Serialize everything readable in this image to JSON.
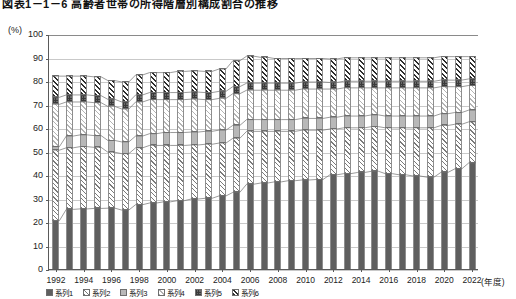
{
  "title": {
    "text": "図表1－1－6 高齢者世帯の所得階層別構成割合の推移",
    "note": "clipped at top edge of screenshot"
  },
  "axes": {
    "y_unit_label": "(%)",
    "y_ticks": [
      0,
      10,
      20,
      30,
      40,
      50,
      60,
      70,
      80,
      90,
      100
    ],
    "y_min": 0,
    "y_max": 100,
    "x_unit_label": "(年度)",
    "x_ticks": [
      "1992",
      "1994",
      "1996",
      "1998",
      "2000",
      "2002",
      "2004",
      "2006",
      "2008",
      "2010",
      "2012",
      "2014",
      "2016",
      "2018",
      "2020",
      "2022"
    ]
  },
  "legend": {
    "note": "legend row clipped at bottom edge of screenshot",
    "items": [
      {
        "label": "系列1",
        "pattern": "solid-gray",
        "color": "#5f5f5f"
      },
      {
        "label": "系列2",
        "pattern": "diagonal-hatch",
        "color": "#7a7a7a"
      },
      {
        "label": "系列3",
        "pattern": "light-gray",
        "color": "#b8b8b8"
      },
      {
        "label": "系列4",
        "pattern": "light-diagonal",
        "color": "#b4b4b4"
      },
      {
        "label": "系列5",
        "pattern": "cross-check",
        "color": "#6a6a6a"
      },
      {
        "label": "系列6",
        "pattern": "dark-diagonal",
        "color": "#2e2e2e"
      }
    ]
  },
  "chart_data": {
    "type": "bar",
    "stacked": true,
    "title": "図表1－1－6 高齢者世帯の所得階層別構成割合の推移",
    "xlabel": "(年度)",
    "ylabel": "(%)",
    "ylim": [
      0,
      100
    ],
    "grid": true,
    "legend_position": "bottom",
    "categories": [
      "1992",
      "1993",
      "1994",
      "1995",
      "1996",
      "1997",
      "1998",
      "1999",
      "2000",
      "2001",
      "2002",
      "2003",
      "2004",
      "2005",
      "2006",
      "2007",
      "2008",
      "2009",
      "2010",
      "2011",
      "2012",
      "2013",
      "2014",
      "2015",
      "2016",
      "2017",
      "2018",
      "2019",
      "2020",
      "2021",
      "2022"
    ],
    "series": [
      {
        "name": "系列1",
        "pattern": "solid-gray",
        "color": "#5f5f5f",
        "values": [
          21.0,
          25.8,
          26.0,
          26.2,
          26.3,
          25.5,
          27.8,
          28.5,
          29.0,
          29.5,
          30.2,
          30.5,
          31.5,
          33.0,
          36.5,
          37.0,
          37.5,
          38.0,
          38.3,
          38.5,
          40.5,
          41.0,
          41.5,
          42.0,
          41.0,
          40.5,
          40.0,
          39.5,
          41.5,
          43.0,
          45.5
        ]
      },
      {
        "name": "系列2",
        "pattern": "diagonal-hatch",
        "color": "#7a7a7a",
        "values": [
          30.0,
          26.2,
          26.5,
          26.0,
          23.8,
          24.0,
          24.2,
          24.5,
          24.0,
          23.5,
          23.0,
          23.0,
          22.5,
          23.0,
          22.5,
          22.0,
          21.5,
          21.0,
          21.2,
          21.0,
          19.5,
          19.5,
          19.0,
          19.0,
          19.5,
          20.0,
          20.5,
          21.0,
          20.0,
          19.0,
          17.5
        ]
      },
      {
        "name": "系列3",
        "pattern": "light-gray",
        "color": "#b8b8b8",
        "values": [
          1.5,
          5.0,
          5.0,
          5.0,
          5.0,
          5.0,
          5.0,
          5.0,
          5.5,
          5.5,
          5.5,
          5.5,
          5.5,
          5.5,
          5.0,
          5.0,
          5.0,
          5.0,
          5.0,
          5.0,
          5.0,
          5.0,
          5.0,
          5.0,
          5.0,
          5.0,
          5.0,
          5.0,
          5.0,
          5.0,
          5.0
        ]
      },
      {
        "name": "系列4",
        "pattern": "light-diagonal",
        "color": "#b4b4b4",
        "values": [
          18.0,
          14.5,
          14.0,
          14.0,
          14.5,
          14.0,
          14.5,
          14.5,
          14.0,
          14.0,
          14.0,
          13.5,
          13.5,
          13.5,
          12.5,
          12.5,
          12.5,
          12.5,
          12.5,
          12.5,
          12.0,
          12.0,
          12.0,
          11.5,
          12.0,
          12.0,
          12.0,
          12.0,
          11.5,
          11.0,
          10.5
        ]
      },
      {
        "name": "系列5",
        "pattern": "cross-check",
        "color": "#6a6a6a",
        "values": [
          3.0,
          3.0,
          3.0,
          3.0,
          3.0,
          3.0,
          3.0,
          3.0,
          3.0,
          3.0,
          3.0,
          3.0,
          3.0,
          3.0,
          3.0,
          3.0,
          3.0,
          3.0,
          3.0,
          3.0,
          2.8,
          2.8,
          2.8,
          2.8,
          2.8,
          2.8,
          2.8,
          2.8,
          2.8,
          2.8,
          2.8
        ]
      },
      {
        "name": "系列6",
        "pattern": "dark-diagonal",
        "color": "#2e2e2e",
        "values": [
          9.0,
          8.0,
          8.0,
          8.0,
          8.0,
          8.5,
          8.5,
          8.5,
          8.5,
          9.0,
          9.0,
          9.0,
          9.5,
          11.0,
          11.5,
          11.0,
          10.5,
          10.5,
          10.0,
          10.0,
          10.0,
          10.0,
          10.0,
          10.0,
          10.0,
          10.0,
          10.0,
          10.0,
          10.0,
          10.0,
          9.5
        ]
      }
    ]
  }
}
